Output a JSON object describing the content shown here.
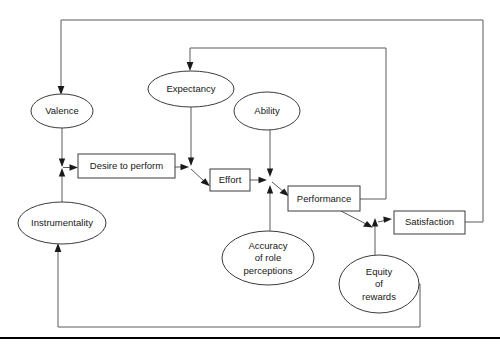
{
  "figure": {
    "type": "flow-diagram",
    "title": "",
    "background_color": "#ffffff",
    "line_color": "#5a5a5a",
    "node_stroke_color": "#3b3b3b",
    "text_color": "#171717",
    "rule_color": "#000000"
  },
  "nodes": [
    {
      "id": "valence",
      "label": "Valence",
      "shape": "ellipse",
      "cx": 62,
      "cy": 111,
      "rx": 31,
      "ry": 17,
      "lines": [
        "Valence"
      ]
    },
    {
      "id": "expectancy",
      "label": "Expectancy",
      "shape": "ellipse",
      "cx": 191,
      "cy": 89,
      "rx": 43,
      "ry": 18,
      "lines": [
        "Expectancy"
      ]
    },
    {
      "id": "ability",
      "label": "Ability",
      "shape": "ellipse",
      "cx": 267,
      "cy": 111,
      "rx": 33,
      "ry": 19,
      "lines": [
        "Ability"
      ]
    },
    {
      "id": "instrumentality",
      "label": "Instrumentality",
      "shape": "ellipse",
      "cx": 62,
      "cy": 223,
      "rx": 44,
      "ry": 21,
      "lines": [
        "Instrumentality"
      ]
    },
    {
      "id": "desire-to-perform",
      "label": "Desire to perform",
      "shape": "rect",
      "x": 78,
      "y": 154,
      "width": 97,
      "height": 24,
      "lines": [
        "Desire to perform"
      ]
    },
    {
      "id": "effort",
      "label": "Effort",
      "shape": "rect",
      "x": 210,
      "y": 169,
      "width": 40,
      "height": 22,
      "lines": [
        "Effort"
      ]
    },
    {
      "id": "performance",
      "label": "Performance",
      "shape": "rect",
      "x": 288,
      "y": 186,
      "width": 72,
      "height": 25,
      "lines": [
        "Performance"
      ]
    },
    {
      "id": "satisfaction",
      "label": "Satisfaction",
      "shape": "rect",
      "x": 394,
      "y": 211,
      "width": 71,
      "height": 23,
      "lines": [
        "Satisfaction"
      ]
    },
    {
      "id": "accuracy-of-role-perceptions",
      "label": "Accuracy of role perceptions",
      "shape": "ellipse",
      "cx": 268,
      "cy": 258,
      "rx": 46,
      "ry": 27,
      "lines": [
        "Accuracy",
        "of role",
        "perceptions"
      ]
    },
    {
      "id": "equity-of-rewards",
      "label": "Equity of rewards",
      "shape": "ellipse",
      "cx": 379,
      "cy": 284,
      "rx": 40,
      "ry": 29,
      "lines": [
        "Equity",
        "of",
        "rewards"
      ]
    }
  ],
  "edges": [
    {
      "id": "satisfaction-to-valence",
      "from": "satisfaction",
      "to": "valence",
      "style": "orthogonal-feedback"
    },
    {
      "id": "performance-to-expectancy",
      "from": "performance",
      "to": "expectancy",
      "style": "orthogonal-feedback"
    },
    {
      "id": "valence-to-desire",
      "from": "valence",
      "to": "desire-to-perform",
      "style": "direct"
    },
    {
      "id": "instrumentality-to-desire",
      "from": "instrumentality",
      "to": "desire-to-perform",
      "style": "direct"
    },
    {
      "id": "desire-to-effort",
      "from": "desire-to-perform",
      "to": "effort",
      "style": "direct"
    },
    {
      "id": "expectancy-to-effort",
      "from": "expectancy",
      "to": "effort",
      "style": "direct"
    },
    {
      "id": "effort-to-performance",
      "from": "effort",
      "to": "performance",
      "style": "direct"
    },
    {
      "id": "ability-to-performance",
      "from": "ability",
      "to": "performance",
      "style": "direct"
    },
    {
      "id": "accuracy-to-performance",
      "from": "accuracy-of-role-perceptions",
      "to": "performance",
      "style": "direct"
    },
    {
      "id": "performance-to-satisfaction",
      "from": "performance",
      "to": "satisfaction",
      "style": "direct"
    },
    {
      "id": "equity-to-satisfaction",
      "from": "equity-of-rewards",
      "to": "satisfaction",
      "style": "direct"
    },
    {
      "id": "equity-to-instrumentality",
      "from": "equity-of-rewards",
      "to": "instrumentality",
      "style": "orthogonal-feedback"
    }
  ],
  "rule": {
    "id": "bottom-rule",
    "y": 338
  }
}
